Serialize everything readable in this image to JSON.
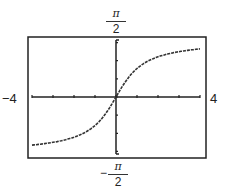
{
  "chart_data": {
    "type": "line",
    "title": "",
    "function": "arctan(x)",
    "xlabel": "",
    "ylabel": "",
    "xlim": [
      -4,
      4
    ],
    "ylim": [
      -1.5708,
      1.5708
    ],
    "x_tick_step": 1,
    "y_tick_step": 0.5,
    "grid": false,
    "labels": {
      "xmin": "−4",
      "xmax": "4",
      "ymax_num": "π",
      "ymax_den": "2",
      "ymin_sign": "−",
      "ymin_num": "π",
      "ymin_den": "2"
    },
    "x": [
      -4,
      -3.5,
      -3,
      -2.5,
      -2,
      -1.5,
      -1,
      -0.5,
      0,
      0.5,
      1,
      1.5,
      2,
      2.5,
      3,
      3.5,
      4
    ],
    "y": [
      -1.326,
      -1.292,
      -1.249,
      -1.19,
      -1.107,
      -0.983,
      -0.785,
      -0.464,
      0,
      0.464,
      0.785,
      0.983,
      1.107,
      1.19,
      1.249,
      1.292,
      1.326
    ]
  },
  "colors": {
    "line": "#333333",
    "frame": "#222222"
  }
}
